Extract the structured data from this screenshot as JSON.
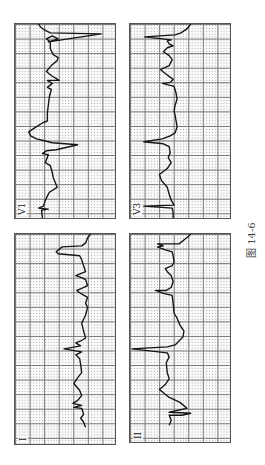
{
  "figure": {
    "caption": "图 14-6"
  },
  "panels": [
    {
      "lead": "V1",
      "position": "top-left",
      "box": {
        "x": 14,
        "y": 23,
        "w": 102,
        "h": 196
      },
      "trace": "M28,196 L27,188 L34,187 L24,186 L29,184 L31,178 L35,170 L43,165 L39,155 L38,150 L36,143 L31,140 L34,132 L28,131 L32,128 L42,127 L64,122 L38,120 L30,118 L22,116 L16,113 L14,109 L20,105 L28,100 L33,98 L33,90 L34,82 L35,74 L37,66 L33,64 L38,60 L33,57 L45,57 L37,52 L32,48 L37,42 L43,37 L44,34 L39,31 L36,25 L36,18 L32,15 L38,12 L42,14 L44,15 L34,18 L88,10 L36,9 L30,6 L26,3 L24,0"
    },
    {
      "lead": "V3",
      "position": "top-right",
      "box": {
        "x": 129,
        "y": 23,
        "w": 102,
        "h": 196
      },
      "trace": "M44,196 L44,190 L43,186 L14,184 L45,183 L42,178 L40,172 L38,165 L32,158 L30,152 L38,146 L42,140 L39,135 L41,130 L40,124 L34,121 L14,119 L33,116 L41,113 L46,110 L48,104 L47,98 L46,92 L45,88 L46,82 L48,76 L47,70 L45,63 L33,60 L41,59 L44,56 L36,50 L31,46 L40,42 L43,36 L40,32 L34,28 L38,24 L44,22 L40,20 L38,17 L42,16 L15,13 L46,11 L52,9 L58,5 L62,0"
    },
    {
      "lead": "I",
      "position": "bottom-left",
      "box": {
        "x": 14,
        "y": 233,
        "w": 102,
        "h": 212
      },
      "trace": "M72,195 L70,190 L67,186 L70,182 L68,176 L60,175 L68,173 L59,171 L64,168 L68,163 L66,158 L60,151 L64,145 L68,140 L67,132 L66,126 L62,122 L68,119 L50,116 L67,113 L62,110 L67,108 L72,105 L70,98 L68,90 L72,82 L74,74 L72,70 L74,64 L67,60 L63,57 L68,55 L74,52 L72,46 L68,44 L62,42 L67,40 L72,38 L70,32 L68,26 L66,22 L44,20 L42,18 L48,13 L68,12 L72,9 L74,4 L77,0"
    },
    {
      "lead": "II",
      "position": "bottom-right",
      "box": {
        "x": 129,
        "y": 233,
        "w": 102,
        "h": 210
      },
      "trace": "M40,193 L42,188 L40,183 L53,183 L62,181 L40,180 L58,176 L51,170 L40,165 L30,157 L36,152 L40,146 L38,140 L37,130 L40,124 L38,120 L2,116 L38,114 L46,112 L50,108 L54,104 L55,98 L51,92 L48,85 L45,80 L44,70 L43,62 L34,60 L26,57 L37,57 L42,54 L44,48 L42,42 L38,38 L36,35 L43,32 L45,28 L44,22 L43,18 L36,16 L28,13 L34,12 L28,10 L50,10 L55,6 L60,2 L62,0"
    }
  ],
  "colors": {
    "trace": "#151515",
    "grid_major": "#777777",
    "grid_minor_dots": "#aaaaaa",
    "paper": "#fafafa",
    "caption": "#444444"
  }
}
